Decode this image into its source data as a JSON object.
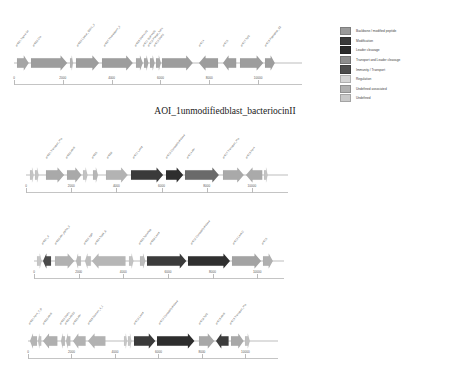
{
  "figure": {
    "title": "AOI_1unmodifiedblast_bacteriocinII",
    "title_top": 106
  },
  "colors": {
    "backbone": "#9a9a9a",
    "modification": "#3a3a3a",
    "leader_cleavage": "#2b2b2b",
    "transport_and_leader_cleavage": "#8d8d8d",
    "immunity_transport": "#4d4d4d",
    "regulation": "#d6d6d6",
    "undefined_associated": "#b0b0b0",
    "undefined": "#c9c9c9",
    "axis": "#c4c4c4",
    "baseline": "#bdbdbd",
    "label_text": "#4a4a4a"
  },
  "legend": {
    "top": 27,
    "items": [
      {
        "label": "Backbone / modified peptide",
        "color_key": "backbone",
        "color": "#9a9a9a"
      },
      {
        "label": "Modification",
        "color_key": "modification",
        "color": "#3a3a3a"
      },
      {
        "label": "Leader cleavage",
        "color_key": "leader_cleavage",
        "color": "#2b2b2b"
      },
      {
        "label": "Transport and Leader cleavage",
        "color_key": "transport_and_leader_cleavage",
        "color": "#8d8d8d"
      },
      {
        "label": "Immunity / Transport",
        "color_key": "immunity_transport",
        "color": "#4d4d4d"
      },
      {
        "label": "Regulation",
        "color_key": "regulation",
        "color": "#d6d6d6"
      },
      {
        "label": "Undefined associated",
        "color_key": "undefined_associated",
        "color": "#b0b0b0"
      },
      {
        "label": "Undefined",
        "color_key": "undefined",
        "color": "#c9c9c9"
      }
    ]
  },
  "panels": [
    {
      "name": "panel-1",
      "top": 48,
      "left": 14,
      "width": 288,
      "axis_top": 78,
      "scale_max": 11800,
      "ticks": [
        {
          "value": 0,
          "label": "0"
        },
        {
          "value": 2000,
          "label": "2000"
        },
        {
          "value": 4000,
          "label": "4000"
        },
        {
          "value": 6000,
          "label": "6000"
        },
        {
          "value": 8000,
          "label": "8000"
        },
        {
          "value": 10000,
          "label": "10000"
        }
      ],
      "genes": [
        {
          "label": "orf001 Sigma-54",
          "start": 120,
          "end": 600,
          "dir": 1,
          "color": "#a5a5a5"
        },
        {
          "label": "orf002 Cfa",
          "start": 700,
          "end": 2180,
          "dir": 1,
          "color": "#9d9d9d"
        },
        {
          "label": "",
          "start": 2290,
          "end": 2400,
          "dir": 1,
          "color": "#b4b4b4"
        },
        {
          "label": "orf003 Lipase_GDSL_3",
          "start": 2560,
          "end": 3500,
          "dir": 1,
          "color": "#9d9d9d"
        },
        {
          "label": "orf007 Thioredoxin_3",
          "start": 3620,
          "end": 4880,
          "dir": 1,
          "color": "#9d9d9d"
        },
        {
          "label": "orf008 DUF4143",
          "start": 5000,
          "end": 5280,
          "dir": 1,
          "color": "#a8a8a8"
        },
        {
          "label": "orf011 DUF4405",
          "start": 5340,
          "end": 5520,
          "dir": 1,
          "color": "#a8a8a8"
        },
        {
          "label": "orf012 Phage_holin",
          "start": 5560,
          "end": 5750,
          "dir": 1,
          "color": "#a8a8a8"
        },
        {
          "label": "orf013 DUF3",
          "start": 5800,
          "end": 6000,
          "dir": 1,
          "color": "#a8a8a8"
        },
        {
          "label": "",
          "start": 6060,
          "end": 7320,
          "dir": 1,
          "color": "#9d9d9d"
        },
        {
          "label": "orf014",
          "start": 7560,
          "end": 8340,
          "dir": -1,
          "color": "#9d9d9d"
        },
        {
          "label": "orf015",
          "start": 8560,
          "end": 9100,
          "dir": -1,
          "color": "#9d9d9d"
        },
        {
          "label": "orf017 TolC",
          "start": 9280,
          "end": 10230,
          "dir": 1,
          "color": "#9d9d9d"
        },
        {
          "label": "orf018 Peptidase_C2",
          "start": 10300,
          "end": 10700,
          "dir": 1,
          "color": "#9d9d9d"
        }
      ]
    },
    {
      "name": "panel-2",
      "top": 160,
      "left": 26,
      "width": 262,
      "axis_top": 186,
      "scale_max": 11600,
      "ticks": [
        {
          "value": 0,
          "label": "0"
        },
        {
          "value": 2000,
          "label": "2000"
        },
        {
          "value": 4000,
          "label": "4000"
        },
        {
          "value": 6000,
          "label": "6000"
        },
        {
          "value": 8000,
          "label": "8000"
        },
        {
          "value": 10000,
          "label": "10000"
        }
      ],
      "genes": [
        {
          "label": "",
          "start": 180,
          "end": 340,
          "dir": 1,
          "color": "#c4c4c4"
        },
        {
          "label": "",
          "start": 400,
          "end": 560,
          "dir": 1,
          "color": "#c4c4c4"
        },
        {
          "label": "orf001 Transport_Pro",
          "start": 900,
          "end": 1700,
          "dir": 1,
          "color": "#a9a9a9"
        },
        {
          "label": "orf002 AbrB",
          "start": 1800,
          "end": 2440,
          "dir": 1,
          "color": "#a9a9a9"
        },
        {
          "label": "",
          "start": 2540,
          "end": 2740,
          "dir": 1,
          "color": "#c2c2c2"
        },
        {
          "label": "orf005",
          "start": 2980,
          "end": 3200,
          "dir": 1,
          "color": "#b6b6b6"
        },
        {
          "label": "orf006",
          "start": 3560,
          "end": 4520,
          "dir": 1,
          "color": "#b3b3b3"
        },
        {
          "label": "orf011 LanM",
          "start": 4660,
          "end": 6080,
          "dir": 1,
          "color": "#3a3a3a"
        },
        {
          "label": "orf012 Cyclodehydratase",
          "start": 6180,
          "end": 6940,
          "dir": 1,
          "color": "#2e2e2e"
        },
        {
          "label": "orf014 Abi",
          "start": 7040,
          "end": 8540,
          "dir": 1,
          "color": "#6a6a6a"
        },
        {
          "label": "orf017 Transport_Pro",
          "start": 8700,
          "end": 9620,
          "dir": 1,
          "color": "#a9a9a9"
        },
        {
          "label": "orf019 Fer4",
          "start": 9760,
          "end": 10480,
          "dir": -1,
          "color": "#aaaaaa"
        },
        {
          "label": "",
          "start": 10540,
          "end": 10700,
          "dir": 1,
          "color": "#c4c4c4"
        }
      ]
    },
    {
      "name": "panel-3",
      "top": 246,
      "left": 34,
      "width": 250,
      "axis_top": 272,
      "scale_max": 11200,
      "ticks": [
        {
          "value": 0,
          "label": "0"
        },
        {
          "value": 2000,
          "label": "2000"
        },
        {
          "value": 4000,
          "label": "4000"
        },
        {
          "value": 6000,
          "label": "6000"
        },
        {
          "value": 8000,
          "label": "8000"
        },
        {
          "value": 10000,
          "label": "10000"
        }
      ],
      "genes": [
        {
          "label": "",
          "start": 120,
          "end": 330,
          "dir": 1,
          "color": "#c6c6c6"
        },
        {
          "label": "orf001_A",
          "start": 400,
          "end": 760,
          "dir": -1,
          "color": "#4a4a4a"
        },
        {
          "label": "orf002 Abi_alpha_2",
          "start": 940,
          "end": 1800,
          "dir": 1,
          "color": "#b1b1b1"
        },
        {
          "label": "",
          "start": 1860,
          "end": 2080,
          "dir": -1,
          "color": "#b9b9b9"
        },
        {
          "label": "orf003 YjdF",
          "start": 2280,
          "end": 2540,
          "dir": -1,
          "color": "#bdbdbd"
        },
        {
          "label": "orf004 TcdA_E",
          "start": 2620,
          "end": 4120,
          "dir": -1,
          "color": "#b6b6b6"
        },
        {
          "label": "",
          "start": 4260,
          "end": 4460,
          "dir": 1,
          "color": "#c3c3c3"
        },
        {
          "label": "orf005 TetraPep",
          "start": 4760,
          "end": 5000,
          "dir": 1,
          "color": "#bcbcbc"
        },
        {
          "label": "orf006 LanM",
          "start": 5060,
          "end": 6820,
          "dir": 1,
          "color": "#3b3b3b"
        },
        {
          "label": "orf010 Cyclodehydratase",
          "start": 6900,
          "end": 8780,
          "dir": 1,
          "color": "#2f2f2f"
        },
        {
          "label": "orf013 LanKC",
          "start": 8860,
          "end": 10160,
          "dir": 1,
          "color": "#a3a3a3"
        },
        {
          "label": "orf015",
          "start": 10260,
          "end": 10700,
          "dir": 1,
          "color": "#b0b0b0"
        }
      ]
    },
    {
      "name": "panel-4",
      "top": 326,
      "left": 28,
      "width": 250,
      "axis_top": 352,
      "scale_max": 11500,
      "ticks": [
        {
          "value": 0,
          "label": "0"
        },
        {
          "value": 2000,
          "label": "2000"
        },
        {
          "value": 4000,
          "label": "4000"
        },
        {
          "value": 6000,
          "label": "6000"
        },
        {
          "value": 8000,
          "label": "8000"
        },
        {
          "value": 10000,
          "label": "10000"
        }
      ],
      "genes": [
        {
          "label": "orf001 Fer4_7_B",
          "start": 100,
          "end": 420,
          "dir": -1,
          "color": "#b4b4b4"
        },
        {
          "label": "",
          "start": 470,
          "end": 620,
          "dir": -1,
          "color": "#c0c0c0"
        },
        {
          "label": "orf002 AbrB",
          "start": 700,
          "end": 1360,
          "dir": -1,
          "color": "#afafaf"
        },
        {
          "label": "orf003 DUF1",
          "start": 1540,
          "end": 1720,
          "dir": -1,
          "color": "#bababa"
        },
        {
          "label": "orf004 ABC2",
          "start": 1760,
          "end": 1960,
          "dir": -1,
          "color": "#bababa"
        },
        {
          "label": "orf005 Abi",
          "start": 2080,
          "end": 2660,
          "dir": -1,
          "color": "#b2b2b2"
        },
        {
          "label": "orf008 Domain_4_1",
          "start": 2760,
          "end": 3560,
          "dir": -1,
          "color": "#b2b2b2"
        },
        {
          "label": "",
          "start": 4420,
          "end": 4560,
          "dir": 1,
          "color": "#c6c6c6"
        },
        {
          "label": "",
          "start": 4620,
          "end": 4780,
          "dir": 1,
          "color": "#c6c6c6"
        },
        {
          "label": "orf012 LanM",
          "start": 4860,
          "end": 5840,
          "dir": 1,
          "color": "#3a3a3a"
        },
        {
          "label": "orf013 Cyclodehydratase",
          "start": 5920,
          "end": 7640,
          "dir": 1,
          "color": "#2d2d2d"
        },
        {
          "label": "orf016 TolC",
          "start": 7860,
          "end": 8560,
          "dir": 1,
          "color": "#a8a8a8"
        },
        {
          "label": "orf018 AbrB",
          "start": 8660,
          "end": 9240,
          "dir": -1,
          "color": "#3c3c3c"
        },
        {
          "label": "orf019 Transport_Pro",
          "start": 9320,
          "end": 9900,
          "dir": 1,
          "color": "#a8a8a8"
        },
        {
          "label": "",
          "start": 9960,
          "end": 10180,
          "dir": 1,
          "color": "#c0c0c0"
        }
      ]
    }
  ]
}
